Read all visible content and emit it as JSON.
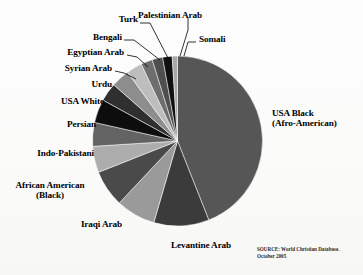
{
  "chart_data": {
    "type": "pie",
    "title": "",
    "subtitle": "",
    "xlabel": "",
    "ylabel": "",
    "legend_position": "callout-labels",
    "grid": false,
    "source_note_line1": "SOURCE: World Christian Database.",
    "source_note_line2": "October 2005",
    "categories": [
      "USA Black (Afro-American)",
      "Levantine Arab",
      "Iraqi Arab",
      "African American (Black)",
      "Indo-Pakistani",
      "Persian",
      "USA White",
      "Urdu",
      "Syrian Arab",
      "Egyptian Arab",
      "Bengali",
      "Turk",
      "Palestinian Arab",
      "Somali"
    ],
    "values": [
      44.0,
      10.5,
      7.5,
      7.0,
      5.0,
      4.5,
      4.5,
      3.5,
      3.5,
      3.0,
      2.2,
      2.0,
      1.8,
      1.0
    ],
    "colors": [
      "#565656",
      "#3b3b3b",
      "#9a9a9a",
      "#4a4a4a",
      "#adadad",
      "#636363",
      "#0d0d0d",
      "#2f2f2f",
      "#8d8d8d",
      "#bdbdbd",
      "#6e6e6e",
      "#4f4f4f",
      "#101010",
      "#a8a8a8"
    ],
    "slices": [
      {
        "label": "USA Black (Afro-American)",
        "value": 44.0,
        "color": "#565656"
      },
      {
        "label": "Levantine Arab",
        "value": 10.5,
        "color": "#3b3b3b"
      },
      {
        "label": "Iraqi Arab",
        "value": 7.5,
        "color": "#9a9a9a"
      },
      {
        "label": "African American (Black)",
        "value": 7.0,
        "color": "#4a4a4a"
      },
      {
        "label": "Indo-Pakistani",
        "value": 5.0,
        "color": "#adadad"
      },
      {
        "label": "Persian",
        "value": 4.5,
        "color": "#636363"
      },
      {
        "label": "USA White",
        "value": 4.5,
        "color": "#0d0d0d"
      },
      {
        "label": "Urdu",
        "value": 3.5,
        "color": "#2f2f2f"
      },
      {
        "label": "Syrian Arab",
        "value": 3.5,
        "color": "#8d8d8d"
      },
      {
        "label": "Egyptian Arab",
        "value": 3.0,
        "color": "#bdbdbd"
      },
      {
        "label": "Bengali",
        "value": 2.2,
        "color": "#6e6e6e"
      },
      {
        "label": "Turk",
        "value": 2.0,
        "color": "#4f4f4f"
      },
      {
        "label": "Palestinian Arab",
        "value": 1.8,
        "color": "#101010"
      },
      {
        "label": "Somali",
        "value": 1.0,
        "color": "#a8a8a8"
      }
    ]
  },
  "labels": {
    "palestinian_arab": "Palestinian Arab",
    "turk": "Turk",
    "somali": "Somali",
    "bengali": "Bengali",
    "egyptian_arab": "Egyptian Arab",
    "syrian_arab": "Syrian Arab",
    "urdu": "Urdu",
    "usa_white": "USA White",
    "persian": "Persian",
    "indo_pakistani": "Indo-Pakistani",
    "african_american_line1": "African American",
    "african_american_line2": "(Black)",
    "iraqi_arab": "Iraqi Arab",
    "levantine_arab": "Levantine Arab",
    "usa_black_line1": "USA Black",
    "usa_black_line2": "(Afro-American)"
  }
}
